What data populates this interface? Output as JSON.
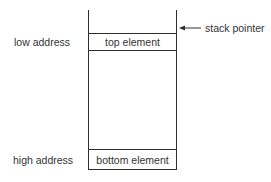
{
  "diagram": {
    "type": "stack-memory-layout",
    "left_labels": {
      "low": "low address",
      "high": "high address"
    },
    "stack": {
      "top_element": "top element",
      "bottom_element": "bottom element"
    },
    "pointer": {
      "label": "stack pointer",
      "arrow_direction": "left"
    },
    "colors": {
      "line": "#2e2e2e",
      "text": "#333333",
      "background": "#ffffff"
    }
  }
}
